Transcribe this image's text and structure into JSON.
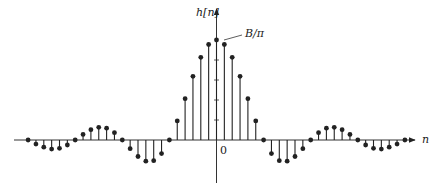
{
  "figure": {
    "y_axis_label": "h[n]",
    "x_axis_label": "n",
    "origin_label": "0",
    "peak_annotation": "B/π"
  },
  "chart_data": {
    "type": "stem",
    "title": "",
    "xlabel": "n",
    "ylabel": "h[n]",
    "annotation": "B/π (peak value at n = 0)",
    "x": [
      -24,
      -23,
      -22,
      -21,
      -20,
      -19,
      -18,
      -17,
      -16,
      -15,
      -14,
      -13,
      -12,
      -11,
      -10,
      -9,
      -8,
      -7,
      -6,
      -5,
      -4,
      -3,
      -2,
      -1,
      0,
      1,
      2,
      3,
      4,
      5,
      6,
      7,
      8,
      9,
      10,
      11,
      12,
      13,
      14,
      15,
      16,
      17,
      18,
      19,
      20,
      21,
      22,
      23,
      24
    ],
    "values": [
      0,
      -0.041,
      -0.072,
      -0.091,
      -0.083,
      -0.05,
      0,
      0.056,
      0.103,
      0.127,
      0.118,
      0.073,
      0,
      -0.087,
      -0.165,
      -0.212,
      -0.207,
      -0.136,
      0,
      0.191,
      0.413,
      0.637,
      0.827,
      0.955,
      1.0,
      0.955,
      0.827,
      0.637,
      0.413,
      0.191,
      0,
      -0.136,
      -0.207,
      -0.212,
      -0.165,
      -0.087,
      0,
      0.073,
      0.118,
      0.127,
      0.103,
      0.056,
      0,
      -0.05,
      -0.083,
      -0.091,
      -0.072,
      -0.041,
      0
    ],
    "xlim": [
      -26,
      26
    ],
    "ylim": [
      -0.3,
      1.3
    ],
    "grid": false,
    "legend": null
  },
  "colors": {
    "stroke": "#222222",
    "background": "#ffffff"
  }
}
